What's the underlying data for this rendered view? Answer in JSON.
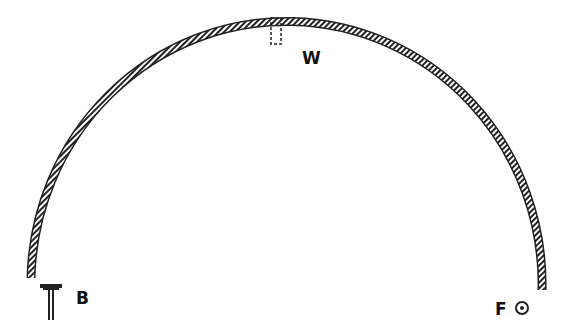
{
  "diagram": {
    "type": "arch-shell-diagram",
    "labels": {
      "W": "W",
      "B": "B",
      "F": "F"
    },
    "elements": [
      {
        "id": "arch",
        "description": "hatched semicircular arch"
      },
      {
        "id": "W",
        "description": "dashed rectangle hanging from top of arch"
      },
      {
        "id": "B",
        "description": "T-shaped stand at left base"
      },
      {
        "id": "F",
        "description": "circle with dot at right base"
      }
    ],
    "colors": {
      "ink": "#111111",
      "background": "#ffffff"
    }
  }
}
